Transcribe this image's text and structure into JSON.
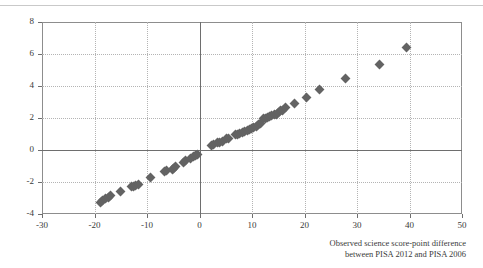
{
  "chart_data": {
    "type": "scatter",
    "title": "",
    "xlabel": "Observed science score-point difference between PISA 2012 and PISA 2006",
    "xlabel_line1": "Observed science score-point difference",
    "xlabel_line2": "between PISA 2012 and PISA 2006",
    "ylabel": "Annualised change in science performance",
    "xlim": [
      -30,
      50
    ],
    "ylim": [
      -4,
      8
    ],
    "xticks": [
      -30,
      -20,
      -10,
      0,
      10,
      20,
      30,
      40,
      50
    ],
    "yticks": [
      -4,
      -2,
      0,
      2,
      4,
      6,
      8
    ],
    "xtick_labels": [
      "-30",
      "-20",
      "-10",
      "0",
      "10",
      "20",
      "30",
      "40",
      "50"
    ],
    "ytick_labels": [
      "-4",
      "-2",
      "0",
      "2",
      "4",
      "6",
      "8"
    ],
    "grid": true,
    "grid_style": "dotted",
    "legend": "none",
    "marker": "diamond",
    "marker_color": "#636363",
    "series": [
      {
        "name": "Countries and economies",
        "points": [
          [
            -18.9,
            -3.25
          ],
          [
            -18.4,
            -3.15
          ],
          [
            -17.9,
            -3.05
          ],
          [
            -17.4,
            -2.95
          ],
          [
            -17.0,
            -2.85
          ],
          [
            -15.0,
            -2.6
          ],
          [
            -12.9,
            -2.3
          ],
          [
            -12.5,
            -2.25
          ],
          [
            -12.1,
            -2.2
          ],
          [
            -11.7,
            -2.15
          ],
          [
            -9.3,
            -1.7
          ],
          [
            -6.7,
            -1.35
          ],
          [
            -6.2,
            -1.3
          ],
          [
            -5.2,
            -1.2
          ],
          [
            -4.9,
            -1.15
          ],
          [
            -4.6,
            -1.05
          ],
          [
            -3.1,
            -0.75
          ],
          [
            -2.6,
            -0.65
          ],
          [
            -1.7,
            -0.5
          ],
          [
            -1.2,
            -0.4
          ],
          [
            -0.7,
            -0.35
          ],
          [
            -0.3,
            -0.3
          ],
          [
            2.2,
            0.3
          ],
          [
            2.6,
            0.35
          ],
          [
            3.4,
            0.45
          ],
          [
            3.9,
            0.5
          ],
          [
            4.4,
            0.55
          ],
          [
            5.2,
            0.7
          ],
          [
            5.6,
            0.75
          ],
          [
            6.9,
            0.95
          ],
          [
            7.3,
            1.0
          ],
          [
            7.7,
            1.05
          ],
          [
            8.2,
            1.1
          ],
          [
            8.6,
            1.15
          ],
          [
            9.1,
            1.2
          ],
          [
            9.5,
            1.3
          ],
          [
            9.9,
            1.35
          ],
          [
            10.3,
            1.4
          ],
          [
            10.8,
            1.45
          ],
          [
            11.2,
            1.6
          ],
          [
            11.6,
            1.65
          ],
          [
            12.1,
            1.95
          ],
          [
            12.5,
            2.0
          ],
          [
            12.9,
            2.05
          ],
          [
            13.4,
            2.1
          ],
          [
            13.8,
            2.15
          ],
          [
            14.2,
            2.2
          ],
          [
            14.6,
            2.25
          ],
          [
            15.1,
            2.35
          ],
          [
            15.5,
            2.45
          ],
          [
            15.9,
            2.5
          ],
          [
            16.4,
            2.65
          ],
          [
            18.1,
            2.9
          ],
          [
            20.3,
            3.3
          ],
          [
            22.9,
            3.8
          ],
          [
            27.8,
            4.5
          ],
          [
            34.2,
            5.35
          ],
          [
            39.4,
            6.4
          ]
        ]
      }
    ]
  }
}
